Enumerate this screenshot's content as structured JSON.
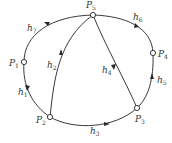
{
  "diagram": {
    "type": "directed-graph",
    "nodes": [
      {
        "id": "P5",
        "name": "P",
        "sub": "5",
        "x": 93,
        "y": 15
      },
      {
        "id": "P1",
        "name": "P",
        "sub": "1",
        "x": 24,
        "y": 62
      },
      {
        "id": "P4",
        "name": "P",
        "sub": "4",
        "x": 153,
        "y": 53
      },
      {
        "id": "P2",
        "name": "P",
        "sub": "2",
        "x": 50,
        "y": 117
      },
      {
        "id": "P3",
        "name": "P",
        "sub": "3",
        "x": 137,
        "y": 108
      }
    ],
    "edges": [
      {
        "id": "h1",
        "name": "h",
        "sub": "1",
        "from": "P1",
        "to": "P2"
      },
      {
        "id": "h2",
        "name": "h",
        "sub": "2",
        "from": "P2",
        "to": "P5"
      },
      {
        "id": "h3",
        "name": "h",
        "sub": "3",
        "from": "P2",
        "to": "P3"
      },
      {
        "id": "h4",
        "name": "h",
        "sub": "4",
        "from": "P5",
        "to": "P3"
      },
      {
        "id": "h5",
        "name": "h",
        "sub": "5",
        "from": "P3",
        "to": "P4"
      },
      {
        "id": "h6",
        "name": "h",
        "sub": "6",
        "from": "P5",
        "to": "P4"
      },
      {
        "id": "h7",
        "name": "h",
        "sub": "7",
        "from": "P1",
        "to": "P5"
      }
    ],
    "colors": {
      "stroke": "#3a3a3a",
      "text": "#333333",
      "background": "#ffffff"
    }
  }
}
